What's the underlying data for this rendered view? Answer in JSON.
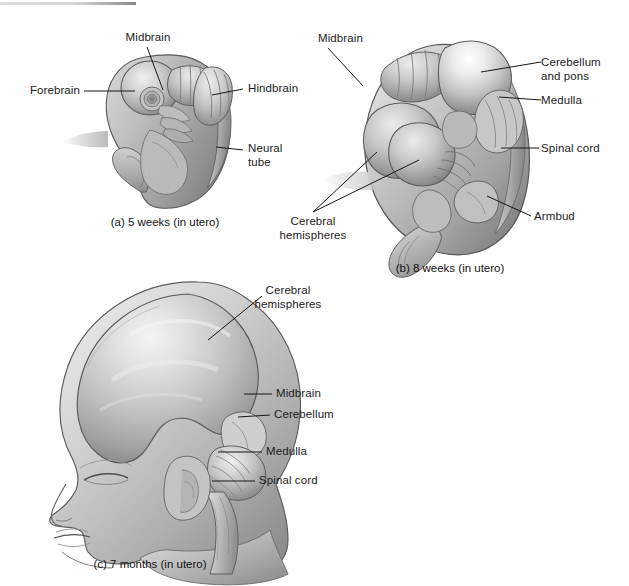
{
  "figure": {
    "background_color": "#ffffff",
    "ink_color": "#1b1b1b",
    "illustration_style": "grayscale airbrush medical illustration"
  },
  "panels": [
    {
      "id": "a",
      "caption": "(a) 5 weeks (in utero)",
      "subject": "five-week human embryo, lateral view",
      "labels": [
        {
          "name": "midbrain",
          "text": "Midbrain"
        },
        {
          "name": "forebrain",
          "text": "Forebrain"
        },
        {
          "name": "hindbrain",
          "text": "Hindbrain"
        },
        {
          "name": "neural-tube",
          "text": "Neural\ntube"
        }
      ]
    },
    {
      "id": "b",
      "caption": "(b) 8 weeks (in utero)",
      "subject": "eight-week human embryo, lateral view",
      "labels": [
        {
          "name": "midbrain",
          "text": "Midbrain"
        },
        {
          "name": "cerebellum-and-pons",
          "text": "Cerebellum\nand pons"
        },
        {
          "name": "medulla",
          "text": "Medulla"
        },
        {
          "name": "spinal-cord",
          "text": "Spinal cord"
        },
        {
          "name": "armbud",
          "text": "Armbud"
        },
        {
          "name": "cerebral-hemispheres",
          "text": "Cerebral\nhemispheres"
        }
      ]
    },
    {
      "id": "c",
      "caption": "(c) 7 months (in utero)",
      "subject": "seven-month fetal head in profile with brain visible",
      "labels": [
        {
          "name": "cerebral-hemispheres",
          "text": "Cerebral\nhemispheres"
        },
        {
          "name": "midbrain",
          "text": "Midbrain"
        },
        {
          "name": "cerebellum",
          "text": "Cerebellum"
        },
        {
          "name": "medulla",
          "text": "Medulla"
        },
        {
          "name": "spinal-cord",
          "text": "Spinal cord"
        }
      ]
    }
  ],
  "palette": {
    "highlight": "#f2f2f2",
    "light": "#dcdcdc",
    "mid": "#b6b6b6",
    "shade": "#909090",
    "dark": "#6e6e6e",
    "outline": "#4a4a4a",
    "scan_artifact": "#8f8f94"
  }
}
